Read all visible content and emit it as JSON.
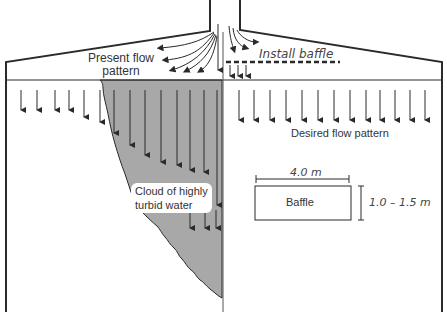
{
  "diagram": {
    "labels": {
      "present_flow": "Present flow\npattern",
      "present_flow_line1": "Present flow",
      "present_flow_line2": "pattern",
      "install_baffle": "Install baffle",
      "desired_flow": "Desired flow pattern",
      "cloud_line1": "Cloud of highly",
      "cloud_line2": "turbid water",
      "baffle": "Baffle",
      "baffle_width": "4.0 m",
      "baffle_height": "1.0 – 1.5 m"
    },
    "colors": {
      "outline": "#2a2a2a",
      "turbid_cloud": "#a8a8a8",
      "text": "#333333",
      "background": "#ffffff"
    },
    "regions": [
      {
        "name": "present-side",
        "description": "Left half showing current inlet jet creating turbid cloud"
      },
      {
        "name": "desired-side",
        "description": "Right half showing uniform downward flow after baffle installation"
      }
    ]
  }
}
